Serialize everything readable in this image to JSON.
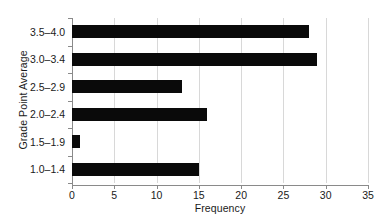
{
  "chart_data": {
    "type": "bar",
    "orientation": "horizontal",
    "title": "",
    "xlabel": "Frequency",
    "ylabel": "Grade Point Average",
    "categories": [
      "3.5–4.0",
      "3.0–3.4",
      "2.5–2.9",
      "2.0–2.4",
      "1.5–1.9",
      "1.0–1.4"
    ],
    "values": [
      28,
      29,
      13,
      16,
      1,
      15
    ],
    "xlim": [
      0,
      35
    ],
    "xticks": [
      0,
      5,
      10,
      15,
      20,
      25,
      30,
      35
    ],
    "xticklabels": [
      "0",
      "5",
      "10",
      "15",
      "20",
      "25",
      "30",
      "35"
    ],
    "grid": "vertical",
    "legend": "none",
    "bar_color": "#0a0a0a",
    "grid_color": "#d8d8d8",
    "axis_color": "#8a8a8a",
    "background_color": "#ffffff"
  }
}
